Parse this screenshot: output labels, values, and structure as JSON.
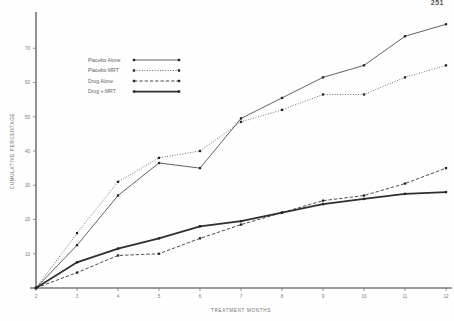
{
  "page_number": "251",
  "chart_data": {
    "type": "line",
    "title": "",
    "xlabel": "TREATMENT MONTHS",
    "ylabel": "CUMULATIVE PERCENTAGE",
    "x": [
      2,
      3,
      4,
      5,
      6,
      7,
      8,
      9,
      10,
      11,
      12
    ],
    "xlim": [
      2,
      12
    ],
    "ylim": [
      0,
      80
    ],
    "xticks": [
      "2",
      "3",
      "4",
      "5",
      "6",
      "7",
      "8",
      "9",
      "10",
      "11",
      "12"
    ],
    "yticks": [
      "10",
      "20",
      "30",
      "40",
      "50",
      "60",
      "70"
    ],
    "ytick_values": [
      10,
      20,
      30,
      40,
      50,
      60,
      70
    ],
    "grid": false,
    "legend_position": "upper-left",
    "series": [
      {
        "name": "Placebo Alone",
        "style": "solid-thin",
        "values": [
          0,
          12.5,
          27,
          36.5,
          35,
          49.5,
          55.5,
          61.5,
          65,
          73.5,
          77
        ]
      },
      {
        "name": "Placebo  MRT",
        "style": "dotted",
        "values": [
          0,
          16,
          31,
          38,
          40,
          48.5,
          52,
          56.5,
          56.5,
          61.5,
          65
        ]
      },
      {
        "name": "Drug Alone",
        "style": "dashed",
        "values": [
          0,
          4.5,
          9.5,
          10,
          14.5,
          18.5,
          22,
          25.5,
          27,
          30.5,
          35
        ]
      },
      {
        "name": "Drug + MRT",
        "style": "solid-thick",
        "values": [
          0,
          7.5,
          11.5,
          14.5,
          18,
          19.5,
          22,
          24.5,
          26,
          27.5,
          28
        ]
      }
    ]
  }
}
